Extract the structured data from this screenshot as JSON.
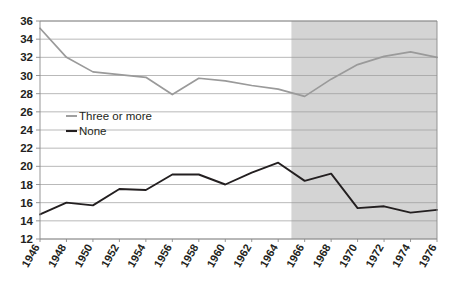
{
  "chart_data": {
    "type": "line",
    "title": "",
    "subtitle": "",
    "xlabel": "",
    "ylabel": "",
    "x": [
      1946,
      1948,
      1950,
      1952,
      1954,
      1956,
      1958,
      1960,
      1962,
      1964,
      1966,
      1968,
      1970,
      1972,
      1974,
      1976
    ],
    "xtick_labels": [
      "1946",
      "1948",
      "1950",
      "1952",
      "1954",
      "1956",
      "1958",
      "1960",
      "1962",
      "1964",
      "1966",
      "1968",
      "1970",
      "1972",
      "1974",
      "1976"
    ],
    "ytick_labels": [
      "12",
      "14",
      "16",
      "18",
      "20",
      "22",
      "24",
      "26",
      "28",
      "30",
      "32",
      "34",
      "36"
    ],
    "yticks": [
      12,
      14,
      16,
      18,
      20,
      22,
      24,
      26,
      28,
      30,
      32,
      34,
      36
    ],
    "ylim": [
      12,
      36
    ],
    "xlim": [
      1946,
      1976
    ],
    "grid": true,
    "grid_axis": "y",
    "legend_position": "inside-left",
    "series": [
      {
        "name": "Three or more",
        "color": "#9a9a9a",
        "values": [
          35.2,
          32.0,
          30.4,
          30.1,
          29.8,
          27.9,
          29.7,
          29.4,
          28.9,
          28.5,
          27.7,
          29.6,
          31.2,
          32.1,
          32.6,
          32.0
        ]
      },
      {
        "name": "None",
        "color": "#231f20",
        "values": [
          14.7,
          16.0,
          15.7,
          17.5,
          17.4,
          19.1,
          19.1,
          18.0,
          19.3,
          20.4,
          18.4,
          19.2,
          15.4,
          15.6,
          14.9,
          15.2
        ]
      }
    ],
    "shaded_region": {
      "label": "",
      "x_start": 1965,
      "x_end": 1976,
      "color": "#d4d4d4"
    },
    "colors": {
      "background": "#ffffff",
      "grid": "#9b9b9b",
      "axis": "#8a8a8a",
      "text": "#231f20",
      "shade": "#d4d4d4"
    }
  },
  "legend": {
    "items": [
      {
        "label": "Three or more",
        "color": "#9a9a9a"
      },
      {
        "label": "None",
        "color": "#231f20"
      }
    ]
  }
}
